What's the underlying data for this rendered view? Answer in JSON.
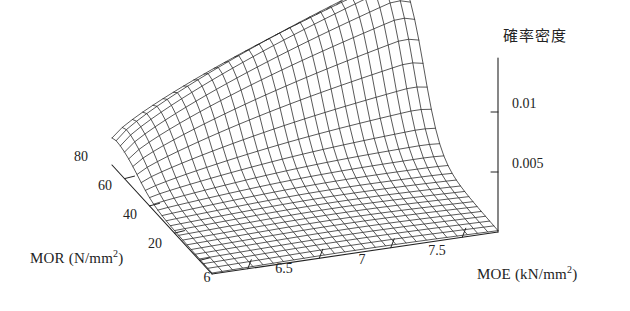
{
  "figure": {
    "background_color": "#ffffff",
    "line_color": "#222222",
    "width": 630,
    "height": 311
  },
  "chart_data": {
    "type": "surface",
    "title": "",
    "zlabel": "確率密度",
    "xlabel": "MOE (kN/mm2)",
    "ylabel": "MOR (N/mm2)",
    "xlabel_main": "MOE",
    "xlabel_unit": "(kN/mm",
    "ylabel_main": "MOR",
    "ylabel_unit": "(N/mm",
    "unit_exponent": "2",
    "unit_close": ")",
    "grid": false,
    "legend": false,
    "projection": "3d-wireframe",
    "xlim": [
      5.75,
      7.75
    ],
    "ylim": [
      10,
      90
    ],
    "zlim": [
      0,
      0.0145
    ],
    "xticks": [
      6,
      6.5,
      7,
      7.5
    ],
    "xtick_labels": [
      "6",
      "6.5",
      "7",
      "7.5"
    ],
    "yticks": [
      20,
      40,
      60,
      80
    ],
    "ytick_labels": [
      "20",
      "40",
      "60",
      "80"
    ],
    "zticks": [
      0.005,
      0.01
    ],
    "ztick_labels": [
      "0.005",
      "0.01"
    ],
    "surface_peak": {
      "x": 7.45,
      "y": 82,
      "z": 0.0142
    },
    "ridge_points": [
      {
        "x": 6.0,
        "y": 80,
        "z": 0.0072
      },
      {
        "x": 6.25,
        "y": 80,
        "z": 0.009
      },
      {
        "x": 6.5,
        "y": 80,
        "z": 0.0106
      },
      {
        "x": 6.75,
        "y": 80,
        "z": 0.0118
      },
      {
        "x": 7.0,
        "y": 80,
        "z": 0.0129
      },
      {
        "x": 7.25,
        "y": 80,
        "z": 0.0137
      },
      {
        "x": 7.5,
        "y": 80,
        "z": 0.0141
      }
    ],
    "mesh_nx": 28,
    "mesh_ny": 24
  },
  "ticks": {
    "z": [
      {
        "label": "0.01",
        "x": 512,
        "y": 103
      },
      {
        "label": "0.005",
        "x": 512,
        "y": 163
      }
    ],
    "mor": [
      {
        "label": "80",
        "x": 82,
        "y": 157
      },
      {
        "label": "60",
        "x": 106,
        "y": 186
      },
      {
        "label": "40",
        "x": 131,
        "y": 215
      },
      {
        "label": "20",
        "x": 156,
        "y": 244
      }
    ],
    "moe": [
      {
        "label": "6",
        "x": 207,
        "y": 276
      },
      {
        "label": "6.5",
        "x": 284,
        "y": 268
      },
      {
        "label": "7",
        "x": 362,
        "y": 259
      },
      {
        "label": "7.5",
        "x": 437,
        "y": 250
      }
    ]
  }
}
